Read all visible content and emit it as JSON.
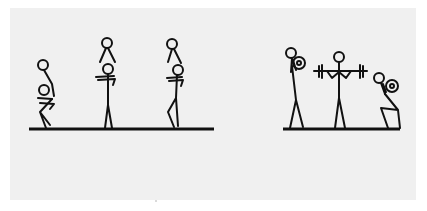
{
  "diagram": {
    "panel_color": "#f0f0f0",
    "line_color": "#111111",
    "groups": [
      {
        "name": "carry-sequence",
        "figures": [
          "crouching-carrier",
          "standing-carrier",
          "squatting-carrier"
        ]
      },
      {
        "name": "weight-lifting-sequence",
        "figures": [
          "standing-plate-holder",
          "barbell-lifter",
          "kneeling-plate-holder"
        ]
      }
    ]
  }
}
